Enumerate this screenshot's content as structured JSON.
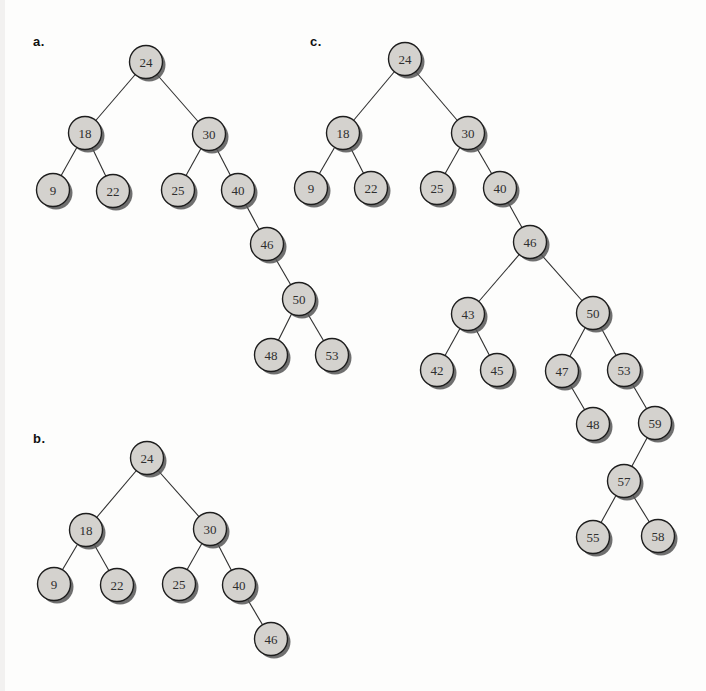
{
  "canvas": {
    "width": 706,
    "height": 691,
    "background": "#fdfdfc"
  },
  "style": {
    "node_fill": "#d4d2ce",
    "node_stroke": "#1e1e1e",
    "node_radius": 16.5,
    "shadow_color": "#565656",
    "shadow_offset": 3,
    "edge_color": "#2f2f2f",
    "text_color": "#2e2e2e",
    "label_color": "#111111"
  },
  "diagrams": [
    {
      "id": "a",
      "label": "a.",
      "label_x": 33,
      "label_y": 34,
      "nodes": [
        {
          "value": "24",
          "x": 146,
          "y": 62
        },
        {
          "value": "18",
          "x": 85,
          "y": 133
        },
        {
          "value": "30",
          "x": 209,
          "y": 134
        },
        {
          "value": "9",
          "x": 53,
          "y": 190
        },
        {
          "value": "22",
          "x": 113,
          "y": 191
        },
        {
          "value": "25",
          "x": 178,
          "y": 190
        },
        {
          "value": "40",
          "x": 238,
          "y": 190
        },
        {
          "value": "46",
          "x": 267,
          "y": 244
        },
        {
          "value": "50",
          "x": 299,
          "y": 299
        },
        {
          "value": "48",
          "x": 271,
          "y": 355
        },
        {
          "value": "53",
          "x": 332,
          "y": 355
        }
      ],
      "edges": [
        [
          0,
          1
        ],
        [
          0,
          2
        ],
        [
          1,
          3
        ],
        [
          1,
          4
        ],
        [
          2,
          5
        ],
        [
          2,
          6
        ],
        [
          6,
          7
        ],
        [
          7,
          8
        ],
        [
          8,
          9
        ],
        [
          8,
          10
        ]
      ]
    },
    {
      "id": "b",
      "label": "b.",
      "label_x": 33,
      "label_y": 431,
      "nodes": [
        {
          "value": "24",
          "x": 147,
          "y": 458
        },
        {
          "value": "18",
          "x": 86,
          "y": 530
        },
        {
          "value": "30",
          "x": 210,
          "y": 529
        },
        {
          "value": "9",
          "x": 54,
          "y": 584
        },
        {
          "value": "22",
          "x": 117,
          "y": 585
        },
        {
          "value": "25",
          "x": 179,
          "y": 584
        },
        {
          "value": "40",
          "x": 239,
          "y": 585
        },
        {
          "value": "46",
          "x": 271,
          "y": 639
        }
      ],
      "edges": [
        [
          0,
          1
        ],
        [
          0,
          2
        ],
        [
          1,
          3
        ],
        [
          1,
          4
        ],
        [
          2,
          5
        ],
        [
          2,
          6
        ],
        [
          6,
          7
        ]
      ]
    },
    {
      "id": "c",
      "label": "c.",
      "label_x": 310,
      "label_y": 34,
      "nodes": [
        {
          "value": "24",
          "x": 405,
          "y": 59
        },
        {
          "value": "18",
          "x": 343,
          "y": 133
        },
        {
          "value": "30",
          "x": 468,
          "y": 133
        },
        {
          "value": "9",
          "x": 311,
          "y": 188
        },
        {
          "value": "22",
          "x": 371,
          "y": 188
        },
        {
          "value": "25",
          "x": 437,
          "y": 188
        },
        {
          "value": "40",
          "x": 500,
          "y": 188
        },
        {
          "value": "46",
          "x": 530,
          "y": 242
        },
        {
          "value": "43",
          "x": 468,
          "y": 314
        },
        {
          "value": "50",
          "x": 593,
          "y": 313
        },
        {
          "value": "42",
          "x": 437,
          "y": 370
        },
        {
          "value": "45",
          "x": 497,
          "y": 370
        },
        {
          "value": "47",
          "x": 562,
          "y": 371
        },
        {
          "value": "53",
          "x": 624,
          "y": 370
        },
        {
          "value": "48",
          "x": 593,
          "y": 424
        },
        {
          "value": "59",
          "x": 655,
          "y": 423
        },
        {
          "value": "57",
          "x": 624,
          "y": 481
        },
        {
          "value": "55",
          "x": 593,
          "y": 537
        },
        {
          "value": "58",
          "x": 658,
          "y": 536
        }
      ],
      "edges": [
        [
          0,
          1
        ],
        [
          0,
          2
        ],
        [
          1,
          3
        ],
        [
          1,
          4
        ],
        [
          2,
          5
        ],
        [
          2,
          6
        ],
        [
          6,
          7
        ],
        [
          7,
          8
        ],
        [
          7,
          9
        ],
        [
          8,
          10
        ],
        [
          8,
          11
        ],
        [
          9,
          12
        ],
        [
          9,
          13
        ],
        [
          12,
          14
        ],
        [
          13,
          15
        ],
        [
          15,
          16
        ],
        [
          16,
          17
        ],
        [
          16,
          18
        ]
      ]
    }
  ]
}
